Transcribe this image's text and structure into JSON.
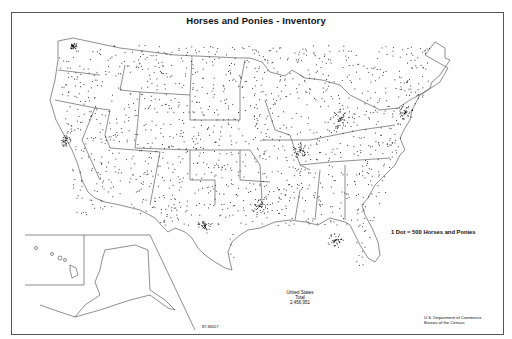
{
  "map": {
    "title": "Horses and Ponies - Inventory",
    "legend": "1 Dot = 500 Horses and Ponies",
    "total": {
      "line1": "United States",
      "line2": "Total",
      "line3": "2,456,951"
    },
    "map_id": "87-M207",
    "credit": {
      "line1": "U.S. Department of Commerce",
      "line2": "Bureau of the Census"
    },
    "regions_shown": [
      "Contiguous United States",
      "Alaska (inset)",
      "Hawaii (inset)"
    ],
    "dot_color": "#111111",
    "border_color": "#555555"
  }
}
